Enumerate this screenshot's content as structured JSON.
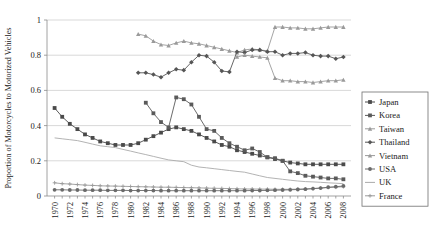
{
  "chart_data": {
    "type": "line",
    "title": "",
    "xlabel": "",
    "ylabel": "Proportion of Motorcycles to Motorized Vehicles",
    "xlim": [
      1969,
      2009
    ],
    "ylim": [
      0,
      1
    ],
    "yticks": [
      "0",
      "0.2",
      "0.4",
      "0.6",
      "0.8",
      "1"
    ],
    "ytick_values": [
      0,
      0.2,
      0.4,
      0.6,
      0.8,
      1
    ],
    "grid": "horizontal",
    "legend_position": "right",
    "xticks": [
      "1970",
      "1972",
      "1974",
      "1976",
      "1978",
      "1980",
      "1982",
      "1984",
      "1986",
      "1988",
      "1990",
      "1992",
      "1994",
      "1996",
      "1998",
      "2000",
      "2002",
      "2004",
      "2006",
      "2008"
    ],
    "x": [
      1970,
      1971,
      1972,
      1973,
      1974,
      1975,
      1976,
      1977,
      1978,
      1979,
      1980,
      1981,
      1982,
      1983,
      1984,
      1985,
      1986,
      1987,
      1988,
      1989,
      1990,
      1991,
      1992,
      1993,
      1994,
      1995,
      1996,
      1997,
      1998,
      1999,
      2000,
      2001,
      2002,
      2003,
      2004,
      2005,
      2006,
      2007,
      2008
    ],
    "series": [
      {
        "name": "Japan",
        "color": "#4a4a4a",
        "marker": "square",
        "values": [
          0.5,
          0.45,
          0.41,
          0.38,
          0.35,
          0.33,
          0.31,
          0.3,
          0.29,
          0.29,
          0.29,
          0.3,
          0.32,
          0.34,
          0.36,
          0.38,
          0.39,
          0.38,
          0.37,
          0.35,
          0.33,
          0.31,
          0.29,
          0.28,
          0.26,
          0.25,
          0.24,
          0.23,
          0.22,
          0.21,
          0.2,
          0.19,
          0.185,
          0.18,
          0.18,
          0.18,
          0.18,
          0.18,
          0.18
        ]
      },
      {
        "name": "Korea",
        "color": "#5a5a5a",
        "marker": "square",
        "values": [
          null,
          null,
          null,
          null,
          null,
          null,
          null,
          null,
          null,
          null,
          null,
          null,
          0.53,
          0.47,
          0.42,
          0.39,
          0.56,
          0.55,
          0.52,
          0.45,
          0.38,
          0.37,
          0.33,
          0.3,
          0.28,
          0.26,
          0.27,
          0.25,
          0.22,
          0.215,
          0.2,
          0.14,
          0.13,
          0.115,
          0.11,
          0.105,
          0.1,
          0.1,
          0.095
        ]
      },
      {
        "name": "Taiwan",
        "color": "#9a9a9a",
        "marker": "triangle",
        "values": [
          null,
          null,
          null,
          null,
          null,
          null,
          null,
          null,
          null,
          null,
          null,
          0.92,
          0.91,
          0.88,
          0.86,
          0.855,
          0.87,
          0.88,
          0.87,
          0.865,
          0.855,
          0.845,
          0.835,
          0.825,
          0.815,
          0.83,
          0.835,
          0.83,
          0.825,
          0.96,
          0.96,
          0.955,
          0.955,
          0.95,
          0.95,
          0.955,
          0.96,
          0.96,
          0.96
        ]
      },
      {
        "name": "Thailand",
        "color": "#555555",
        "marker": "diamond",
        "values": [
          null,
          null,
          null,
          null,
          null,
          null,
          null,
          null,
          null,
          null,
          null,
          0.7,
          0.7,
          0.69,
          0.675,
          0.7,
          0.72,
          0.715,
          0.76,
          0.8,
          0.795,
          0.76,
          0.71,
          0.705,
          0.82,
          0.815,
          0.83,
          0.83,
          0.82,
          0.82,
          0.8,
          0.81,
          0.81,
          0.815,
          0.8,
          0.795,
          0.795,
          0.78,
          0.79
        ]
      },
      {
        "name": "Vietnam",
        "color": "#9a9a9a",
        "marker": "triangle",
        "values": [
          null,
          null,
          null,
          null,
          null,
          null,
          null,
          null,
          null,
          null,
          null,
          null,
          null,
          null,
          null,
          null,
          null,
          null,
          null,
          null,
          null,
          null,
          null,
          null,
          0.79,
          0.8,
          0.795,
          0.79,
          0.785,
          0.67,
          0.655,
          0.655,
          0.65,
          0.65,
          0.645,
          0.65,
          0.655,
          0.655,
          0.66
        ]
      },
      {
        "name": "USA",
        "color": "#6a6a6a",
        "marker": "circle",
        "values": [
          null,
          null,
          null,
          null,
          null,
          null,
          null,
          null,
          null,
          null,
          null,
          null,
          null,
          null,
          null,
          null,
          null,
          null,
          null,
          null,
          null,
          null,
          null,
          null,
          null,
          null,
          null,
          null,
          null,
          null,
          null,
          null,
          null,
          null,
          null,
          null,
          null,
          null,
          null
        ]
      },
      {
        "name": "UK",
        "color": "#aaaaaa",
        "marker": "none",
        "values": [
          0.33,
          0.325,
          0.32,
          0.315,
          0.305,
          0.295,
          0.285,
          0.28,
          0.275,
          0.265,
          0.255,
          0.245,
          0.235,
          0.225,
          0.215,
          0.205,
          0.2,
          0.195,
          0.175,
          0.165,
          0.16,
          0.155,
          0.15,
          0.145,
          0.14,
          0.135,
          0.125,
          0.115,
          0.105,
          0.1,
          0.095,
          0.09,
          0.085,
          0.082,
          0.08,
          0.078,
          0.075,
          0.073,
          0.07
        ]
      },
      {
        "name": "France",
        "color": "#9a9a9a",
        "marker": "cross",
        "values": [
          0.075,
          0.07,
          0.068,
          0.065,
          0.062,
          0.06,
          0.058,
          0.057,
          0.056,
          0.055,
          0.054,
          0.053,
          0.052,
          0.051,
          0.05,
          0.05,
          0.049,
          0.048,
          0.047,
          0.046,
          0.045,
          0.044,
          0.043,
          0.042,
          0.041,
          0.04,
          0.04,
          0.039,
          0.039,
          0.038,
          0.038,
          0.038,
          0.039,
          0.04,
          0.042,
          0.045,
          0.048,
          0.05,
          0.053
        ]
      }
    ],
    "series_extra": [
      {
        "name": "USA",
        "color": "#6a6a6a",
        "marker": "circle",
        "values": [
          0.035,
          0.035,
          0.034,
          0.034,
          0.033,
          0.033,
          0.033,
          0.032,
          0.032,
          0.032,
          0.031,
          0.031,
          0.031,
          0.031,
          0.03,
          0.03,
          0.03,
          0.03,
          0.03,
          0.03,
          0.03,
          0.03,
          0.03,
          0.03,
          0.03,
          0.03,
          0.031,
          0.031,
          0.032,
          0.033,
          0.034,
          0.035,
          0.037,
          0.039,
          0.042,
          0.045,
          0.05,
          0.053,
          0.057
        ]
      }
    ]
  },
  "legend": {
    "items": [
      {
        "label": "Japan",
        "color": "#4a4a4a",
        "marker": "square"
      },
      {
        "label": "Korea",
        "color": "#5a5a5a",
        "marker": "square"
      },
      {
        "label": "Taiwan",
        "color": "#9a9a9a",
        "marker": "triangle"
      },
      {
        "label": "Thailand",
        "color": "#555555",
        "marker": "diamond"
      },
      {
        "label": "Vietnam",
        "color": "#9a9a9a",
        "marker": "triangle"
      },
      {
        "label": "USA",
        "color": "#6a6a6a",
        "marker": "circle"
      },
      {
        "label": "UK",
        "color": "#aaaaaa",
        "marker": "none"
      },
      {
        "label": "France",
        "color": "#9a9a9a",
        "marker": "cross"
      }
    ]
  }
}
